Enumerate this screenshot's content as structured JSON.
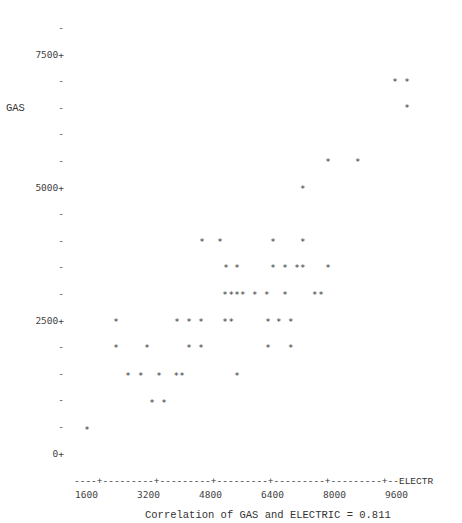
{
  "chart_data": {
    "type": "scatter",
    "title": "",
    "xlabel": "ELECTR",
    "ylabel": "GAS",
    "x_ticks": [
      1600,
      3200,
      4800,
      6400,
      8000,
      9600
    ],
    "y_ticks": [
      0,
      2500,
      5000,
      7500
    ],
    "xlim": [
      1200,
      10200
    ],
    "ylim": [
      0,
      8200
    ],
    "grid": false,
    "legend": null,
    "marker": "*",
    "footnote": "Correlation of GAS and ELECTRIC = 0.811",
    "points": [
      {
        "x": 9550,
        "y": 6980
      },
      {
        "x": 9860,
        "y": 6980
      },
      {
        "x": 9860,
        "y": 6490
      },
      {
        "x": 7820,
        "y": 5480
      },
      {
        "x": 8590,
        "y": 5480
      },
      {
        "x": 7170,
        "y": 4970
      },
      {
        "x": 4570,
        "y": 3980
      },
      {
        "x": 5030,
        "y": 3980
      },
      {
        "x": 6400,
        "y": 3980
      },
      {
        "x": 7170,
        "y": 3980
      },
      {
        "x": 5190,
        "y": 3490
      },
      {
        "x": 5470,
        "y": 3490
      },
      {
        "x": 6400,
        "y": 3490
      },
      {
        "x": 6710,
        "y": 3490
      },
      {
        "x": 7020,
        "y": 3490
      },
      {
        "x": 7170,
        "y": 3490
      },
      {
        "x": 7820,
        "y": 3490
      },
      {
        "x": 5160,
        "y": 2980
      },
      {
        "x": 5320,
        "y": 2980
      },
      {
        "x": 5470,
        "y": 2980
      },
      {
        "x": 5620,
        "y": 2980
      },
      {
        "x": 5930,
        "y": 2980
      },
      {
        "x": 6240,
        "y": 2980
      },
      {
        "x": 6710,
        "y": 2980
      },
      {
        "x": 7480,
        "y": 2980
      },
      {
        "x": 7640,
        "y": 2980
      },
      {
        "x": 2350,
        "y": 2480
      },
      {
        "x": 3920,
        "y": 2480
      },
      {
        "x": 4230,
        "y": 2480
      },
      {
        "x": 4540,
        "y": 2480
      },
      {
        "x": 5160,
        "y": 2480
      },
      {
        "x": 5320,
        "y": 2480
      },
      {
        "x": 6270,
        "y": 2480
      },
      {
        "x": 6550,
        "y": 2480
      },
      {
        "x": 6860,
        "y": 2480
      },
      {
        "x": 2350,
        "y": 1990
      },
      {
        "x": 3150,
        "y": 1990
      },
      {
        "x": 4230,
        "y": 1990
      },
      {
        "x": 4540,
        "y": 1990
      },
      {
        "x": 6270,
        "y": 1990
      },
      {
        "x": 6860,
        "y": 1990
      },
      {
        "x": 2660,
        "y": 1460
      },
      {
        "x": 2990,
        "y": 1460
      },
      {
        "x": 3460,
        "y": 1460
      },
      {
        "x": 3900,
        "y": 1460
      },
      {
        "x": 4050,
        "y": 1460
      },
      {
        "x": 5470,
        "y": 1460
      },
      {
        "x": 3280,
        "y": 960
      },
      {
        "x": 3590,
        "y": 960
      },
      {
        "x": 1600,
        "y": 450
      }
    ]
  },
  "plot": {
    "y_axis_label": "GAS",
    "x_axis_line": "----+---------+---------+---------+---------+---------+--ELECTR",
    "x_tick_labels": [
      "1600",
      "3200",
      "4800",
      "6400",
      "8000",
      "9600"
    ],
    "y_rows": [
      "-",
      "7500+",
      "-",
      "-",
      "-",
      "-",
      "5000+",
      "-",
      "-",
      "-",
      "-",
      "2500+",
      "-",
      "-",
      "-",
      "-",
      "0+"
    ],
    "correlation_text": "Correlation of GAS and ELECTRIC = 0.811",
    "star_glyph": "*"
  }
}
